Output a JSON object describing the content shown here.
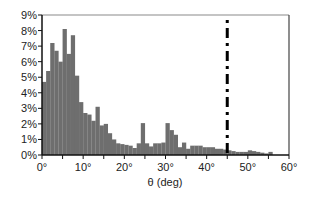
{
  "chart_data": {
    "type": "bar",
    "title": "",
    "xlabel": "θ (deg)",
    "ylabel": "",
    "xlim": [
      0,
      60
    ],
    "ylim": [
      0,
      9
    ],
    "bin_width": 1,
    "grid": false,
    "legend": null,
    "x_ticks": [
      "0°",
      "10°",
      "20°",
      "30°",
      "40°",
      "50°",
      "60°"
    ],
    "x_tick_values": [
      0,
      10,
      20,
      30,
      40,
      50,
      60
    ],
    "y_ticks": [
      "0%",
      "1%",
      "2%",
      "3%",
      "4%",
      "5%",
      "6%",
      "7%",
      "8%",
      "9%"
    ],
    "y_tick_values": [
      0,
      1,
      2,
      3,
      4,
      5,
      6,
      7,
      8,
      9
    ],
    "bar_color": "#6e6e6e",
    "bin_starts": [
      0,
      1,
      2,
      3,
      4,
      5,
      6,
      7,
      8,
      9,
      10,
      11,
      12,
      13,
      14,
      15,
      16,
      17,
      18,
      19,
      20,
      21,
      22,
      23,
      24,
      25,
      26,
      27,
      28,
      29,
      30,
      31,
      32,
      33,
      34,
      35,
      36,
      37,
      38,
      39,
      40,
      41,
      42,
      43,
      44,
      45,
      46,
      47,
      48,
      49,
      50,
      51,
      52,
      53,
      54,
      55
    ],
    "values": [
      4.7,
      5.4,
      7.2,
      6.7,
      6.0,
      8.1,
      6.5,
      7.7,
      5.1,
      3.4,
      2.7,
      2.6,
      2.2,
      3.1,
      1.9,
      2.0,
      1.4,
      1.0,
      0.75,
      0.7,
      0.65,
      0.6,
      0.45,
      0.75,
      2.05,
      0.75,
      0.55,
      0.75,
      0.75,
      0.8,
      2.05,
      1.6,
      1.3,
      0.5,
      0.8,
      0.4,
      0.6,
      0.6,
      0.6,
      0.5,
      0.5,
      0.5,
      0.4,
      0.4,
      0.35,
      0.3,
      0.25,
      0.2,
      0.2,
      0.2,
      0.3,
      0.25,
      0.2,
      0.15,
      0.1,
      0.2
    ],
    "annotations": [
      {
        "type": "vertical_line",
        "x": 45,
        "style": "dash-dot",
        "color": "#000000"
      }
    ]
  }
}
